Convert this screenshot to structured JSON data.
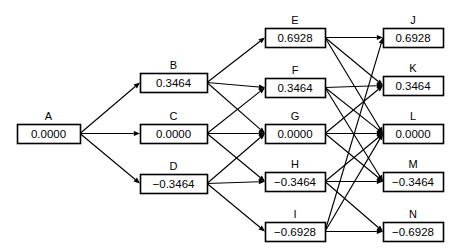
{
  "diagram": {
    "type": "trellis-lattice",
    "background_color": "#ffffff",
    "line_color": "#000000",
    "box_fill": "#ffffff",
    "columns": [
      {
        "id": "col0",
        "x_center": 48.5,
        "node_ids": [
          "A"
        ]
      },
      {
        "id": "col1",
        "x_center": 173.5,
        "node_ids": [
          "B",
          "C",
          "D"
        ]
      },
      {
        "id": "col2",
        "x_center": 295.0,
        "node_ids": [
          "E",
          "F",
          "G",
          "H",
          "I"
        ]
      },
      {
        "id": "col3",
        "x_center": 413.0,
        "node_ids": [
          "J",
          "K",
          "L",
          "M",
          "N"
        ]
      }
    ],
    "nodes": [
      {
        "id": "A",
        "label": "A",
        "value": "0.0000",
        "x": 17,
        "y": 124,
        "w": 63,
        "h": 19
      },
      {
        "id": "B",
        "label": "B",
        "value": "0.3464",
        "x": 140,
        "y": 73,
        "w": 67,
        "h": 19
      },
      {
        "id": "C",
        "label": "C",
        "value": "0.0000",
        "x": 140,
        "y": 124,
        "w": 67,
        "h": 19
      },
      {
        "id": "D",
        "label": "D",
        "value": "−0.3464",
        "x": 140,
        "y": 174,
        "w": 67,
        "h": 19
      },
      {
        "id": "E",
        "label": "E",
        "value": "0.6928",
        "x": 265,
        "y": 28,
        "w": 60,
        "h": 19
      },
      {
        "id": "F",
        "label": "F",
        "value": "0.3464",
        "x": 265,
        "y": 78,
        "w": 60,
        "h": 19
      },
      {
        "id": "G",
        "label": "G",
        "value": "0.0000",
        "x": 265,
        "y": 124,
        "w": 60,
        "h": 19
      },
      {
        "id": "H",
        "label": "H",
        "value": "−0.3464",
        "x": 265,
        "y": 172,
        "w": 60,
        "h": 19
      },
      {
        "id": "I",
        "label": "I",
        "value": "−0.6928",
        "x": 265,
        "y": 222,
        "w": 60,
        "h": 19
      },
      {
        "id": "J",
        "label": "J",
        "value": "0.6928",
        "x": 383,
        "y": 28,
        "w": 60,
        "h": 19
      },
      {
        "id": "K",
        "label": "K",
        "value": "0.3464",
        "x": 383,
        "y": 76,
        "w": 60,
        "h": 19
      },
      {
        "id": "L",
        "label": "L",
        "value": "0.0000",
        "x": 383,
        "y": 124,
        "w": 60,
        "h": 19
      },
      {
        "id": "M",
        "label": "M",
        "value": "−0.3464",
        "x": 383,
        "y": 172,
        "w": 60,
        "h": 19
      },
      {
        "id": "N",
        "label": "N",
        "value": "−0.6928",
        "x": 383,
        "y": 222,
        "w": 60,
        "h": 19
      }
    ],
    "edges": [
      {
        "from": "A",
        "to": "B"
      },
      {
        "from": "A",
        "to": "C"
      },
      {
        "from": "A",
        "to": "D"
      },
      {
        "from": "B",
        "to": "E"
      },
      {
        "from": "B",
        "to": "F"
      },
      {
        "from": "B",
        "to": "G"
      },
      {
        "from": "C",
        "to": "F"
      },
      {
        "from": "C",
        "to": "G"
      },
      {
        "from": "C",
        "to": "H"
      },
      {
        "from": "D",
        "to": "G"
      },
      {
        "from": "D",
        "to": "H"
      },
      {
        "from": "D",
        "to": "I"
      },
      {
        "from": "E",
        "to": "J"
      },
      {
        "from": "E",
        "to": "K"
      },
      {
        "from": "E",
        "to": "L"
      },
      {
        "from": "F",
        "to": "K"
      },
      {
        "from": "F",
        "to": "L"
      },
      {
        "from": "F",
        "to": "M"
      },
      {
        "from": "G",
        "to": "K"
      },
      {
        "from": "G",
        "to": "L"
      },
      {
        "from": "G",
        "to": "M"
      },
      {
        "from": "H",
        "to": "L"
      },
      {
        "from": "H",
        "to": "M"
      },
      {
        "from": "H",
        "to": "N"
      },
      {
        "from": "I",
        "to": "J"
      },
      {
        "from": "I",
        "to": "L"
      },
      {
        "from": "I",
        "to": "N"
      }
    ]
  }
}
